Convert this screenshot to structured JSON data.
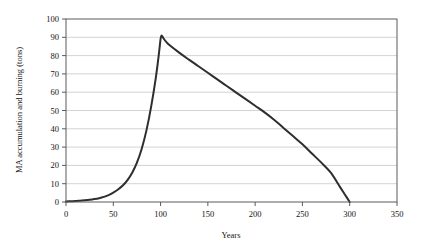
{
  "chart_data": {
    "type": "line",
    "title": "",
    "xlabel": "Years",
    "ylabel": "MA accumulation and burning (tons)",
    "xlim": [
      0,
      350
    ],
    "ylim": [
      0,
      100
    ],
    "xticks": [
      0,
      50,
      100,
      150,
      200,
      250,
      300,
      350
    ],
    "yticks": [
      0,
      10,
      20,
      30,
      40,
      50,
      60,
      70,
      80,
      90,
      100
    ],
    "xtick_labels": [
      "0",
      "50",
      "100",
      "150",
      "200",
      "250",
      "300",
      "350"
    ],
    "ytick_labels": [
      "0",
      "10",
      "20",
      "30",
      "40",
      "50",
      "60",
      "70",
      "80",
      "90",
      "100"
    ],
    "grid": "horizontal",
    "grid_color": "#c8c8c8",
    "legend": "none",
    "line_color": "#2e2e2e",
    "line_width": 2,
    "series": [
      {
        "name": "MA accumulation and burning",
        "x": [
          0,
          5,
          10,
          15,
          20,
          25,
          30,
          35,
          40,
          45,
          50,
          55,
          60,
          65,
          70,
          75,
          80,
          85,
          90,
          95,
          98,
          100,
          101,
          103,
          106,
          110,
          120,
          130,
          140,
          150,
          160,
          170,
          180,
          190,
          200,
          210,
          220,
          230,
          240,
          250,
          260,
          270,
          280,
          290,
          295,
          300
        ],
        "y": [
          0.3,
          0.4,
          0.5,
          0.7,
          0.9,
          1.2,
          1.6,
          2.1,
          2.8,
          3.8,
          5.1,
          6.8,
          9.0,
          12.0,
          16.0,
          21.5,
          29.0,
          39.0,
          52.0,
          68.0,
          80.0,
          89.0,
          91.0,
          89.5,
          87.5,
          85.5,
          81.5,
          77.8,
          74.2,
          70.6,
          67.0,
          63.4,
          59.8,
          56.2,
          52.6,
          49.0,
          45.0,
          40.5,
          36.0,
          31.5,
          26.5,
          21.5,
          16.0,
          8.0,
          4.0,
          0.0
        ]
      }
    ],
    "peak": {
      "x": 100,
      "y": 91
    },
    "end_point": {
      "x": 300,
      "y": 0
    }
  },
  "figure": {
    "background_color": "#ffffff",
    "axis_color": "#5a5a5a",
    "text_color": "#141414"
  }
}
